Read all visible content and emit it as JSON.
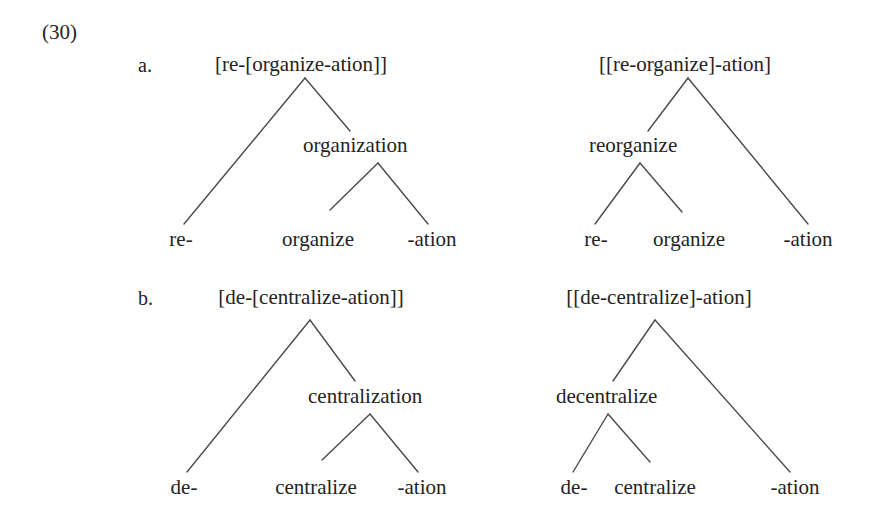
{
  "figure": {
    "example_number": "(30)",
    "background_color": "#ffffff",
    "line_color": "#4a4a4a",
    "text_color": "#232323"
  },
  "items": [
    {
      "letter": "a.",
      "trees": [
        {
          "root": "[re-[organize-ation]]",
          "intermediate": "organization",
          "leaves": [
            "re-",
            "organize",
            "-ation"
          ]
        },
        {
          "root": "[[re-organize]-ation]",
          "intermediate": "reorganize",
          "leaves": [
            "re-",
            "organize",
            "-ation"
          ]
        }
      ]
    },
    {
      "letter": "b.",
      "trees": [
        {
          "root": "[de-[centralize-ation]]",
          "intermediate": "centralization",
          "leaves": [
            "de-",
            "centralize",
            "-ation"
          ]
        },
        {
          "root": "[[de-centralize]-ation]",
          "intermediate": "decentralize",
          "leaves": [
            "de-",
            "centralize",
            "-ation"
          ]
        }
      ]
    }
  ]
}
